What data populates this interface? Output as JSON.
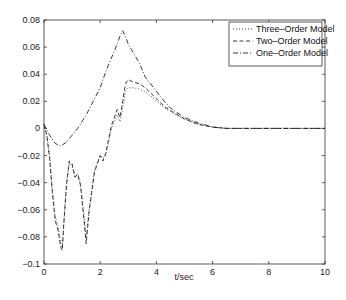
{
  "chart_data": {
    "type": "line",
    "title": "",
    "xlabel": "t/sec",
    "ylabel": "",
    "xlim": [
      0,
      10
    ],
    "ylim": [
      -0.1,
      0.08
    ],
    "xticks": [
      "0",
      "2",
      "4",
      "6",
      "8",
      "10"
    ],
    "yticks": [
      "0.08",
      "0.06",
      "0.04",
      "0.02",
      "0",
      "-0.02",
      "-0.04",
      "-0.06",
      "-0.08",
      "-0.1"
    ],
    "grid": false,
    "legend_position": "upper right",
    "series": [
      {
        "name": "Three-Order Model",
        "style": "dotted",
        "x": [
          0,
          0.1,
          0.2,
          0.3,
          0.4,
          0.5,
          0.6,
          0.65,
          0.7,
          0.8,
          0.9,
          1.0,
          1.1,
          1.2,
          1.3,
          1.4,
          1.5,
          1.6,
          1.7,
          1.8,
          1.9,
          2.0,
          2.1,
          2.2,
          2.3,
          2.4,
          2.5,
          2.6,
          2.7,
          2.8,
          2.9,
          3.0,
          3.2,
          3.4,
          3.6,
          3.8,
          4.0,
          4.3,
          4.6,
          5.0,
          5.5,
          6.0,
          6.5,
          7.0,
          8.0,
          9.0,
          10.0
        ],
        "y": [
          0.003,
          -0.005,
          -0.02,
          -0.045,
          -0.065,
          -0.072,
          -0.085,
          -0.088,
          -0.07,
          -0.04,
          -0.025,
          -0.028,
          -0.035,
          -0.033,
          -0.04,
          -0.06,
          -0.08,
          -0.06,
          -0.045,
          -0.03,
          -0.025,
          -0.02,
          -0.022,
          -0.02,
          -0.01,
          0.0,
          0.005,
          0.01,
          0.005,
          0.015,
          0.028,
          0.03,
          0.03,
          0.029,
          0.027,
          0.024,
          0.02,
          0.015,
          0.011,
          0.007,
          0.003,
          0.001,
          0.0,
          0.0,
          0.0,
          0.0,
          0.0
        ]
      },
      {
        "name": "Two-Order Model",
        "style": "dashed",
        "x": [
          0,
          0.1,
          0.2,
          0.3,
          0.4,
          0.5,
          0.6,
          0.65,
          0.7,
          0.8,
          0.9,
          1.0,
          1.1,
          1.2,
          1.3,
          1.4,
          1.5,
          1.6,
          1.7,
          1.8,
          1.9,
          2.0,
          2.1,
          2.2,
          2.3,
          2.4,
          2.5,
          2.6,
          2.7,
          2.8,
          2.9,
          3.0,
          3.2,
          3.4,
          3.6,
          3.8,
          4.0,
          4.3,
          4.6,
          5.0,
          5.5,
          6.0,
          6.5,
          7.0,
          8.0,
          9.0,
          10.0
        ],
        "y": [
          0.003,
          -0.005,
          -0.022,
          -0.048,
          -0.068,
          -0.075,
          -0.088,
          -0.09,
          -0.072,
          -0.042,
          -0.024,
          -0.026,
          -0.036,
          -0.034,
          -0.042,
          -0.062,
          -0.085,
          -0.062,
          -0.047,
          -0.032,
          -0.026,
          -0.02,
          -0.024,
          -0.018,
          -0.008,
          0.002,
          0.008,
          0.014,
          0.008,
          0.02,
          0.033,
          0.036,
          0.034,
          0.033,
          0.03,
          0.026,
          0.022,
          0.016,
          0.012,
          0.007,
          0.003,
          0.001,
          0.0,
          0.0,
          0.0,
          0.0,
          0.0
        ]
      },
      {
        "name": "One-Order Model",
        "style": "dashdot",
        "x": [
          0,
          0.2,
          0.4,
          0.6,
          0.8,
          1.0,
          1.2,
          1.5,
          1.8,
          2.0,
          2.2,
          2.4,
          2.6,
          2.7,
          2.8,
          2.9,
          3.0,
          3.2,
          3.4,
          3.6,
          3.9,
          4.2,
          4.5,
          5.0,
          5.5,
          6.0,
          6.5,
          7.0,
          8.0,
          9.0,
          10.0
        ],
        "y": [
          0.003,
          -0.005,
          -0.011,
          -0.013,
          -0.01,
          -0.005,
          0.0,
          0.01,
          0.022,
          0.03,
          0.042,
          0.052,
          0.062,
          0.068,
          0.072,
          0.068,
          0.062,
          0.055,
          0.048,
          0.038,
          0.03,
          0.022,
          0.015,
          0.008,
          0.004,
          0.001,
          0.0,
          0.0,
          0.0,
          0.0,
          0.0
        ]
      }
    ]
  }
}
